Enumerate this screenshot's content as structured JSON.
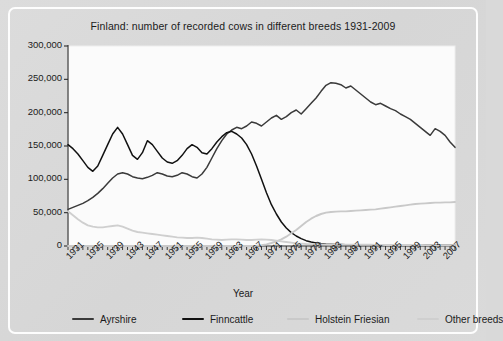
{
  "chart_data": {
    "type": "line",
    "title": "Finland: number of recorded cows in different breeds 1931-2009",
    "xlabel": "Year",
    "ylabel": "",
    "xlim": [
      1931,
      2009
    ],
    "ylim": [
      0,
      300000
    ],
    "grid": false,
    "legend_position": "bottom",
    "y_ticks": [
      0,
      50000,
      100000,
      150000,
      200000,
      250000,
      300000
    ],
    "y_tick_labels": [
      "0",
      "50,000",
      "100,000",
      "150,000",
      "200,000",
      "250,000",
      "300,000"
    ],
    "x_tick_labels": [
      "1931",
      "1935",
      "1939",
      "1943",
      "1947",
      "1951",
      "1955",
      "1959",
      "1963",
      "1967",
      "1971",
      "1975",
      "1979",
      "1983",
      "1987",
      "1991",
      "1995",
      "1999",
      "2003",
      "2007"
    ],
    "x_tick_step_minor": 1,
    "x_tick_step_major": 4,
    "x": [
      1931,
      1932,
      1933,
      1934,
      1935,
      1936,
      1937,
      1938,
      1939,
      1940,
      1941,
      1942,
      1943,
      1944,
      1945,
      1946,
      1947,
      1948,
      1949,
      1950,
      1951,
      1952,
      1953,
      1954,
      1955,
      1956,
      1957,
      1958,
      1959,
      1960,
      1961,
      1962,
      1963,
      1964,
      1965,
      1966,
      1967,
      1968,
      1969,
      1970,
      1971,
      1972,
      1973,
      1974,
      1975,
      1976,
      1977,
      1978,
      1979,
      1980,
      1981,
      1982,
      1983,
      1984,
      1985,
      1986,
      1987,
      1988,
      1989,
      1990,
      1991,
      1992,
      1993,
      1994,
      1995,
      1996,
      1997,
      1998,
      1999,
      2000,
      2001,
      2002,
      2003,
      2004,
      2005,
      2006,
      2007,
      2008,
      2009
    ],
    "series": [
      {
        "name": "Ayrshire",
        "color": "#3a3a3a",
        "values": [
          55000,
          58000,
          61000,
          64000,
          68000,
          73000,
          79000,
          86000,
          94000,
          102000,
          108000,
          110000,
          108000,
          104000,
          102000,
          101000,
          103000,
          106000,
          110000,
          108000,
          105000,
          104000,
          106000,
          110000,
          108000,
          104000,
          102000,
          108000,
          118000,
          132000,
          146000,
          158000,
          168000,
          174000,
          178000,
          176000,
          180000,
          186000,
          184000,
          180000,
          186000,
          192000,
          196000,
          190000,
          194000,
          200000,
          204000,
          198000,
          206000,
          214000,
          222000,
          232000,
          241000,
          245000,
          244000,
          242000,
          237000,
          240000,
          234000,
          228000,
          222000,
          216000,
          212000,
          214000,
          210000,
          206000,
          203000,
          198000,
          194000,
          190000,
          184000,
          178000,
          172000,
          166000,
          176000,
          172000,
          166000,
          156000,
          148000
        ]
      },
      {
        "name": "Finncattle",
        "color": "#111111",
        "values": [
          152000,
          146000,
          138000,
          128000,
          118000,
          112000,
          120000,
          136000,
          152000,
          168000,
          178000,
          168000,
          152000,
          136000,
          130000,
          140000,
          158000,
          152000,
          142000,
          132000,
          126000,
          124000,
          128000,
          136000,
          146000,
          152000,
          148000,
          140000,
          138000,
          146000,
          156000,
          164000,
          170000,
          172000,
          168000,
          162000,
          152000,
          138000,
          120000,
          100000,
          80000,
          62000,
          48000,
          36000,
          27000,
          20000,
          15000,
          11000,
          8000,
          6000,
          4500,
          3600,
          3000,
          2600,
          2300,
          2100,
          2000,
          1900,
          1800,
          1800,
          1700,
          1700,
          1600,
          1600,
          1600,
          1500,
          1500,
          1500,
          1400,
          1400,
          1400,
          1300,
          1300,
          1300,
          1200,
          1200,
          1200,
          1100,
          1100
        ]
      },
      {
        "name": "Holstein Friesian",
        "color": "#c9c9c9",
        "values": [
          0,
          0,
          0,
          0,
          0,
          0,
          0,
          0,
          0,
          0,
          0,
          0,
          0,
          0,
          0,
          0,
          0,
          0,
          0,
          0,
          0,
          0,
          0,
          0,
          0,
          0,
          0,
          0,
          0,
          0,
          0,
          0,
          0,
          0,
          0,
          0,
          0,
          0,
          500,
          1200,
          2500,
          4500,
          7000,
          10000,
          14000,
          19000,
          24000,
          30000,
          36000,
          41000,
          45000,
          48000,
          50000,
          51000,
          51500,
          52000,
          52000,
          52500,
          53000,
          53500,
          54000,
          54500,
          55000,
          56000,
          57000,
          58000,
          59000,
          60000,
          61000,
          62000,
          63000,
          63500,
          64000,
          64500,
          65000,
          65000,
          65500,
          65500,
          66000
        ]
      },
      {
        "name": "Other breeds",
        "color": "#cfcfcf",
        "values": [
          52000,
          46000,
          40000,
          35000,
          31000,
          29000,
          28000,
          28000,
          29000,
          30000,
          31000,
          29000,
          26000,
          23000,
          21000,
          20000,
          19000,
          18000,
          17000,
          16000,
          15000,
          14000,
          13000,
          12500,
          12000,
          12000,
          12500,
          12000,
          11000,
          10000,
          9500,
          9000,
          9500,
          10000,
          10000,
          9500,
          9000,
          9000,
          9500,
          10000,
          9500,
          9000,
          8000,
          7000,
          6000,
          5000,
          4000,
          3500,
          3000,
          2800,
          2600,
          2500,
          2400,
          2300,
          2200,
          2100,
          2000,
          2000,
          1900,
          1900,
          1800,
          1800,
          1700,
          1700,
          1600,
          1600,
          1500,
          1500,
          1500,
          1400,
          1400,
          1400,
          1300,
          1300,
          1300,
          1200,
          1200,
          1200,
          1100
        ]
      }
    ]
  },
  "legend": {
    "items": [
      {
        "label": "Ayrshire",
        "color": "#3a3a3a"
      },
      {
        "label": "Finncattle",
        "color": "#111111"
      },
      {
        "label": "Holstein Friesian",
        "color": "#c9c9c9"
      },
      {
        "label": "Other breeds",
        "color": "#cfcfcf"
      }
    ]
  }
}
